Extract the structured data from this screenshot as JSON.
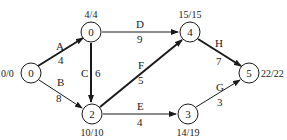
{
  "diagram": {
    "type": "activity-network",
    "nodes": [
      {
        "id": "0",
        "label": "0",
        "time": "0/0",
        "x": 31,
        "y": 73
      },
      {
        "id": "1",
        "label": "1",
        "time": "4/4",
        "x": 91,
        "y": 32
      },
      {
        "id": "2",
        "label": "2",
        "time": "10/10",
        "x": 92,
        "y": 114
      },
      {
        "id": "3",
        "label": "3",
        "time": "14/19",
        "x": 188,
        "y": 114
      },
      {
        "id": "4",
        "label": "4",
        "time": "15/15",
        "x": 190,
        "y": 32
      },
      {
        "id": "5",
        "label": "5",
        "time": "22/22",
        "x": 249,
        "y": 73
      }
    ],
    "edges": [
      {
        "activity": "A",
        "duration": "4",
        "from": "0",
        "to": "1",
        "critical": true
      },
      {
        "activity": "B",
        "duration": "8",
        "from": "0",
        "to": "2",
        "critical": false
      },
      {
        "activity": "C",
        "duration": "6",
        "from": "1",
        "to": "2",
        "critical": true
      },
      {
        "activity": "D",
        "duration": "9",
        "from": "1",
        "to": "4",
        "critical": false
      },
      {
        "activity": "E",
        "duration": "4",
        "from": "2",
        "to": "3",
        "critical": false
      },
      {
        "activity": "F",
        "duration": "5",
        "from": "2",
        "to": "4",
        "critical": true
      },
      {
        "activity": "G",
        "duration": "3",
        "from": "3",
        "to": "5",
        "critical": false
      },
      {
        "activity": "H",
        "duration": "7",
        "from": "4",
        "to": "5",
        "critical": true
      }
    ],
    "colors": {
      "ink": "#1a1a1a",
      "background": "#ffffff"
    }
  }
}
